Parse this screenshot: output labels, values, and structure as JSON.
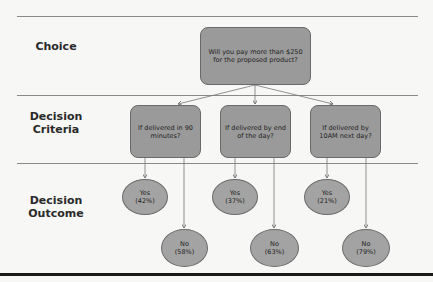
{
  "rows": [
    {
      "label": "Choice"
    },
    {
      "label": "Decision Criteria"
    },
    {
      "label": "Decision Outcome"
    }
  ],
  "root": {
    "text": "Will you pay more than $250 for the proposed product?"
  },
  "criteria": [
    {
      "text": "If delivered in 90 minutes?",
      "yes": {
        "label": "Yes",
        "value": "(42%)"
      },
      "no": {
        "label": "No",
        "value": "(58%)"
      }
    },
    {
      "text": "If delivered by end of the day?",
      "yes": {
        "label": "Yes",
        "value": "(37%)"
      },
      "no": {
        "label": "No",
        "value": "(63%)"
      }
    },
    {
      "text": "If delivered by 10AM next day?",
      "yes": {
        "label": "Yes",
        "value": "(21%)"
      },
      "no": {
        "label": "No",
        "value": "(79%)"
      }
    }
  ],
  "colors": {
    "box_fill": "#9a9a9a",
    "ellipse_fill": "#a3a3a3",
    "line": "#8a8a8a",
    "text": "#222222"
  }
}
